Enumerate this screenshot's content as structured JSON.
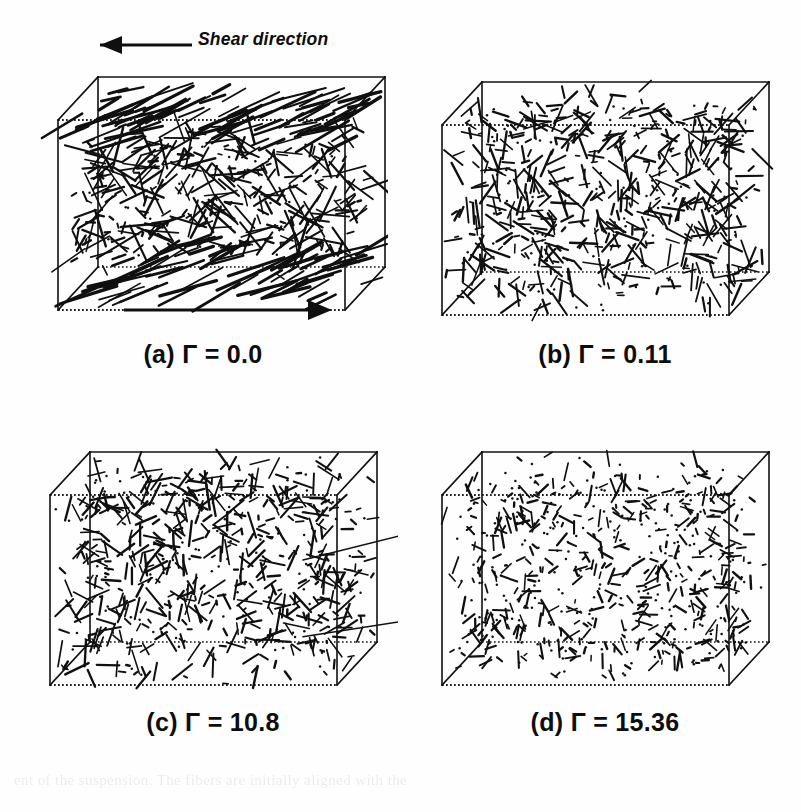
{
  "figure": {
    "annotation": {
      "shear_direction_label": "Shear direction",
      "top_arrow_icon": "arrow-left-icon",
      "bottom_arrow_icon": "arrow-right-icon"
    },
    "ink_color": "#101010",
    "paper_color": "#fefefe"
  },
  "page_bleed_text": "ent of the suspension. The fibers are initially aligned with the",
  "chart_data": {
    "type": "scatter",
    "xlabel": "",
    "ylabel": "",
    "annotations": [
      "Shear direction"
    ],
    "panels": [
      {
        "id": "a",
        "caption": "(a)  Γ = 0.0",
        "label_prefix": "(a)",
        "symbol": "Γ",
        "strain": 0.0,
        "strain_text": "0.0",
        "n_fibers": 520,
        "state": "aligned-at-walls",
        "description": "Strongly aligned fibers in top and bottom shear layers, more random in the core",
        "mean_angle_deg": -22,
        "angle_spread_deg": 14,
        "core_angle_spread_deg": 80,
        "mean_length_px": 26,
        "wall_length_px": 40,
        "seed": 101,
        "has_shear_arrows": true
      },
      {
        "id": "b",
        "caption": "(b)  Γ = 0.11",
        "label_prefix": "(b)",
        "symbol": "Γ",
        "strain": 0.11,
        "strain_text": "0.11",
        "n_fibers": 620,
        "state": "randomising",
        "description": "Short randomly oriented segments throughout the cell",
        "mean_angle_deg": 0,
        "angle_spread_deg": 90,
        "core_angle_spread_deg": 90,
        "mean_length_px": 13,
        "wall_length_px": 13,
        "seed": 202,
        "has_shear_arrows": false
      },
      {
        "id": "c",
        "caption": "(c)  Γ = 10.8",
        "label_prefix": "(c)",
        "symbol": "Γ",
        "strain": 10.8,
        "strain_text": "10.8",
        "n_fibers": 640,
        "state": "random",
        "description": "Isotropic short segments, two long fibers protrude through the right face",
        "mean_angle_deg": 0,
        "angle_spread_deg": 90,
        "core_angle_spread_deg": 90,
        "mean_length_px": 12,
        "wall_length_px": 12,
        "seed": 303,
        "has_shear_arrows": false,
        "protruding_fibers": 2
      },
      {
        "id": "d",
        "caption": "(d)  Γ = 15.36",
        "label_prefix": "(d)",
        "symbol": "Γ",
        "strain": 15.36,
        "strain_text": "15.36",
        "n_fibers": 660,
        "state": "random-out-of-plane",
        "description": "Mostly foreshortened dots, fibers pointing out of the viewing plane",
        "mean_angle_deg": 0,
        "angle_spread_deg": 90,
        "core_angle_spread_deg": 90,
        "mean_length_px": 8,
        "wall_length_px": 8,
        "seed": 404,
        "has_shear_arrows": false
      }
    ],
    "box_geometry": {
      "front_face_width_px": 287,
      "front_face_height_px": 190,
      "depth_offset_x_px": 40,
      "depth_offset_y_px": -43,
      "hidden_edges": "dotted"
    }
  }
}
